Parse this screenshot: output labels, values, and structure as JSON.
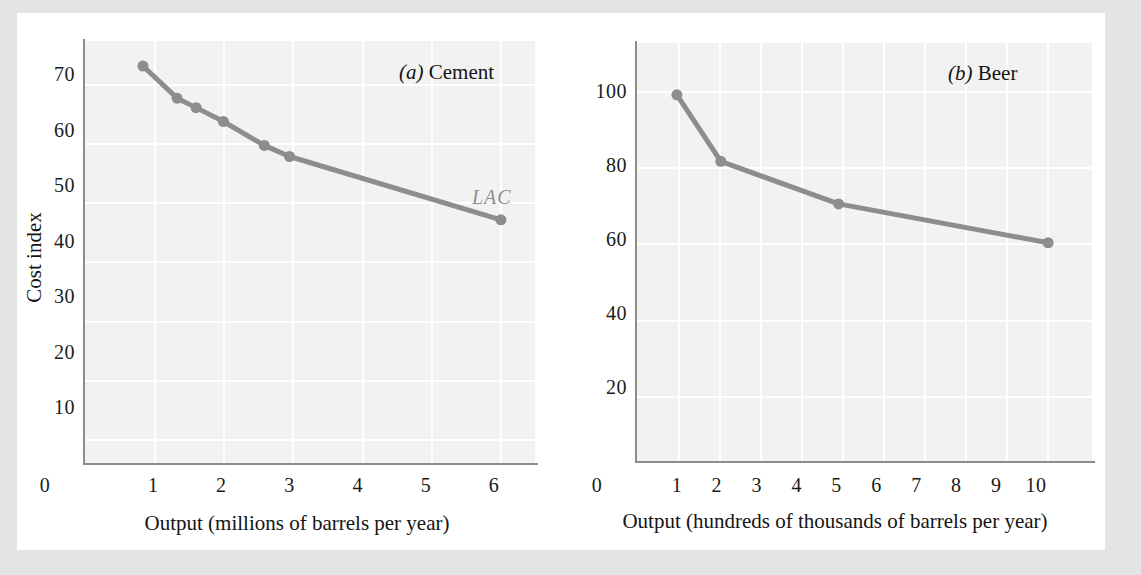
{
  "figure": {
    "background": "#e4e4e4",
    "card_background": "#ffffff",
    "plot_background": "#f2f2f2",
    "gridline_color": "#ffffff",
    "axis_color": "#8d8d8d",
    "series_color": "#8d8d8d",
    "text_color": "#141414"
  },
  "chart_data": [
    {
      "type": "line",
      "panel_id": "a",
      "panel_label": "(a)",
      "panel_name": "Cement",
      "title": "(a) Cement",
      "xlabel": "Output (millions of barrels per year)",
      "ylabel": "Cost index",
      "xlim": [
        0,
        6.6
      ],
      "ylim": [
        0,
        76
      ],
      "xticks": [
        0,
        1,
        2,
        3,
        4,
        5,
        6
      ],
      "xticklabels": [
        "0",
        "1",
        "2",
        "3",
        "4",
        "5",
        "6"
      ],
      "yticks": [
        10,
        20,
        30,
        40,
        50,
        60,
        70
      ],
      "yticklabels": [
        "10",
        "20",
        "30",
        "40",
        "50",
        "60",
        "70"
      ],
      "grid": true,
      "legend": "none",
      "annotations": [
        {
          "text": "LAC",
          "x": 5.6,
          "y": 50.5,
          "style": "italic",
          "color": "#8d8d8d"
        }
      ],
      "series": [
        {
          "name": "LAC",
          "marker": "circle",
          "x": [
            0.85,
            1.35,
            1.63,
            2.03,
            2.63,
            3.0,
            6.1
          ],
          "y": [
            71.5,
            65.7,
            64.0,
            61.5,
            57.2,
            55.2,
            43.8
          ]
        }
      ]
    },
    {
      "type": "line",
      "panel_id": "b",
      "panel_label": "(b)",
      "panel_name": "Beer",
      "title": "(b) Beer",
      "xlabel": "Output (hundreds of thousands of barrels per year)",
      "ylabel": "",
      "xlim": [
        0,
        11.4
      ],
      "ylim": [
        0,
        113
      ],
      "xticks": [
        0,
        1,
        2,
        3,
        4,
        5,
        6,
        7,
        8,
        9,
        10
      ],
      "xticklabels": [
        "0",
        "1",
        "2",
        "3",
        "4",
        "5",
        "6",
        "7",
        "8",
        "9",
        "10"
      ],
      "yticks": [
        20,
        40,
        60,
        80,
        100
      ],
      "yticklabels": [
        "20",
        "40",
        "60",
        "80",
        "100"
      ],
      "grid": true,
      "legend": "none",
      "annotations": [
        {
          "text": "LAC",
          "x": 9.3,
          "y": 65.5,
          "style": "italic",
          "color": "#8d8d8d"
        }
      ],
      "series": [
        {
          "name": "LAC",
          "marker": "circle",
          "x": [
            1.0,
            2.1,
            5.05,
            10.3
          ],
          "y": [
            99.0,
            81.0,
            69.5,
            59.0
          ]
        }
      ]
    }
  ]
}
